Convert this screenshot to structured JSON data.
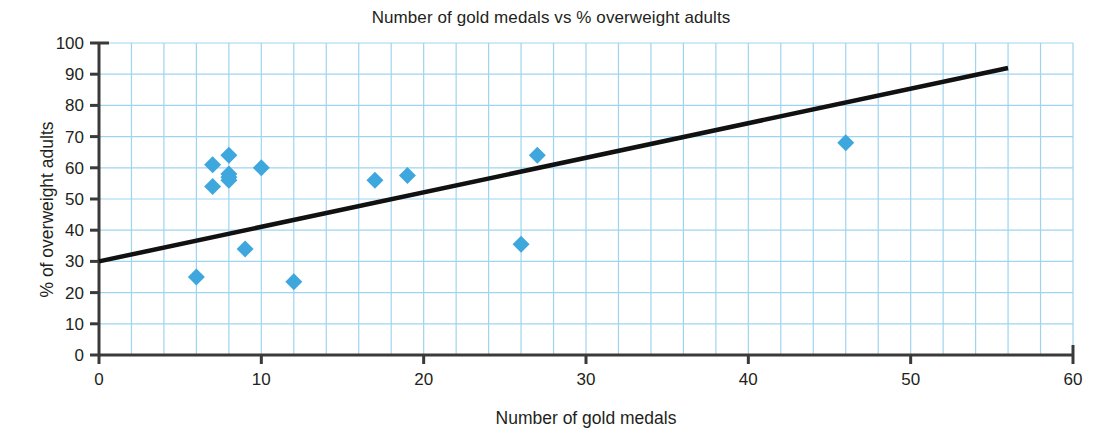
{
  "chart_data": {
    "type": "scatter",
    "title": "Number of gold medals vs % overweight adults",
    "xlabel": "Number of gold medals",
    "ylabel": "% of overweight adults",
    "xlim": [
      0,
      60
    ],
    "ylim": [
      0,
      100
    ],
    "xticks": [
      0,
      10,
      20,
      30,
      40,
      50,
      60
    ],
    "yticks": [
      0,
      10,
      20,
      30,
      40,
      50,
      60,
      70,
      80,
      90,
      100
    ],
    "xtick_labels": [
      "0",
      "10",
      "20",
      "30",
      "40",
      "50",
      "60"
    ],
    "ytick_labels": [
      "0",
      "10",
      "20",
      "30",
      "40",
      "50",
      "60",
      "70",
      "80",
      "90",
      "100"
    ],
    "grid": true,
    "grid_color": "#9ed4ef",
    "grid_x_step": 2,
    "grid_y_step": 10,
    "legend": "none",
    "marker_shape": "diamond",
    "marker_color": "#3ea7dd",
    "points": [
      {
        "x": 6,
        "y": 25
      },
      {
        "x": 7,
        "y": 61
      },
      {
        "x": 7,
        "y": 54
      },
      {
        "x": 8,
        "y": 64
      },
      {
        "x": 8,
        "y": 58
      },
      {
        "x": 8,
        "y": 57
      },
      {
        "x": 8,
        "y": 56
      },
      {
        "x": 9,
        "y": 34
      },
      {
        "x": 10,
        "y": 60
      },
      {
        "x": 12,
        "y": 23.5
      },
      {
        "x": 17,
        "y": 56
      },
      {
        "x": 19,
        "y": 57.5
      },
      {
        "x": 26,
        "y": 35.5
      },
      {
        "x": 27,
        "y": 64
      },
      {
        "x": 46,
        "y": 68
      }
    ],
    "trend_line": {
      "color": "#111111",
      "x_start": 0,
      "y_start": 30,
      "x_end": 56,
      "y_end": 92
    }
  }
}
